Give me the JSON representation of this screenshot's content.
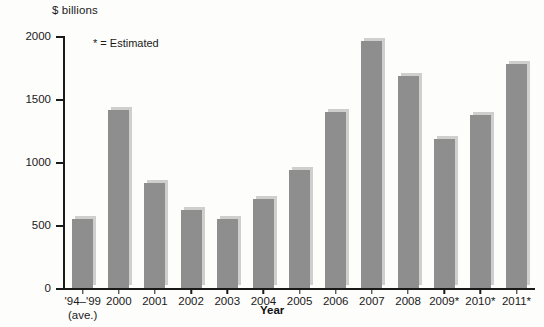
{
  "chart_data": {
    "type": "bar",
    "title": "",
    "subtitle": "",
    "ylabel": "$ billions",
    "xlabel": "Year",
    "ylim": [
      0,
      2000
    ],
    "yticks": [
      0,
      500,
      1000,
      1500,
      2000
    ],
    "ytick_labels": [
      "0",
      "500",
      "1000",
      "1500",
      "2000"
    ],
    "grid": false,
    "legend": null,
    "annotations": [
      "* = Estimated"
    ],
    "bar_color": "#8e8e8e",
    "categories": [
      "'94–'99",
      "2000",
      "2001",
      "2002",
      "2003",
      "2004",
      "2005",
      "2006",
      "2007",
      "2008",
      "2009*",
      "2010*",
      "2011*"
    ],
    "category_sublabels": [
      "(ave.)",
      "",
      "",
      "",
      "",
      "",
      "",
      "",
      "",
      "",
      "",
      "",
      ""
    ],
    "values": [
      545,
      1410,
      830,
      620,
      545,
      705,
      940,
      1400,
      1960,
      1680,
      1180,
      1370,
      1780
    ]
  },
  "axis": {
    "y_label": "$ billions",
    "x_label": "Year"
  },
  "note": {
    "estimated": "* = Estimated"
  }
}
